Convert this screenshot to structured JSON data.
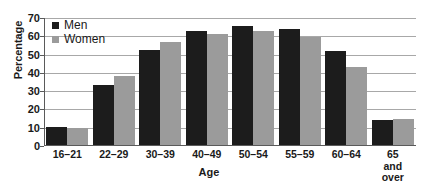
{
  "chart_data": {
    "type": "bar",
    "title": "",
    "xlabel": "Age",
    "ylabel": "Percentage",
    "ylim": [
      0,
      70
    ],
    "ytick_step": 10,
    "yticks": [
      0,
      10,
      20,
      30,
      40,
      50,
      60,
      70
    ],
    "grid": true,
    "legend_position": "top-left",
    "categories": [
      "16–21",
      "22–29",
      "30–39",
      "40–49",
      "50–54",
      "55–59",
      "60–64",
      "65 and\nover"
    ],
    "series": [
      {
        "name": "Men",
        "color": "#1c1c1c",
        "values": [
          10.5,
          33.5,
          52.5,
          63,
          65.5,
          64,
          52,
          14
        ]
      },
      {
        "name": "Women",
        "color": "#9b9b9b",
        "values": [
          10,
          38.5,
          57,
          61,
          63,
          59.5,
          43,
          15
        ]
      }
    ]
  },
  "colors": {
    "men": "#1c1c1c",
    "women": "#9b9b9b",
    "gridline": "#a8a8a8",
    "axis": "#5a5a5a",
    "text": "#1a1a1a",
    "background": "#ffffff"
  }
}
